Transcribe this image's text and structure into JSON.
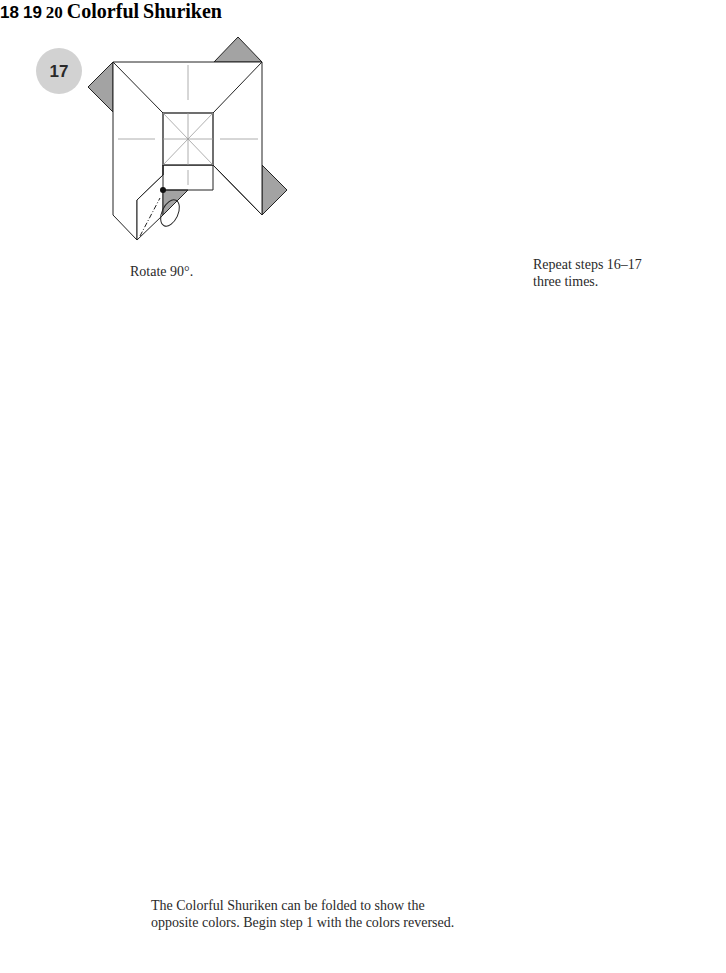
{
  "steps": [
    {
      "number": "17",
      "caption": "Rotate 90°."
    },
    {
      "number": "18",
      "caption_line1": "Repeat steps 16–17",
      "caption_line2": "three times."
    },
    {
      "number": "19"
    },
    {
      "number": "20"
    }
  ],
  "model_title": {
    "line1": "Colorful",
    "line2": "Shuriken"
  },
  "note": {
    "line1": "The Colorful Shuriken can be folded to show the",
    "line2": "opposite colors. Begin step 1 with the colors reversed."
  },
  "icons": {
    "turn_over": "turn-over-arrow-icon",
    "push_arrow": "push-arrow-icon",
    "fold_arrow": "fold-arrow-icon",
    "unfold_arrow": "valley-fold-unfold-arrow-icon"
  },
  "colors": {
    "badge": "#d2d2d2",
    "paper_colored": "#a3a3a3",
    "background_circle": "#7b7b7b",
    "title_badge": "#d6d6d6",
    "line": "#222222",
    "crease": "#9a9a9a"
  }
}
